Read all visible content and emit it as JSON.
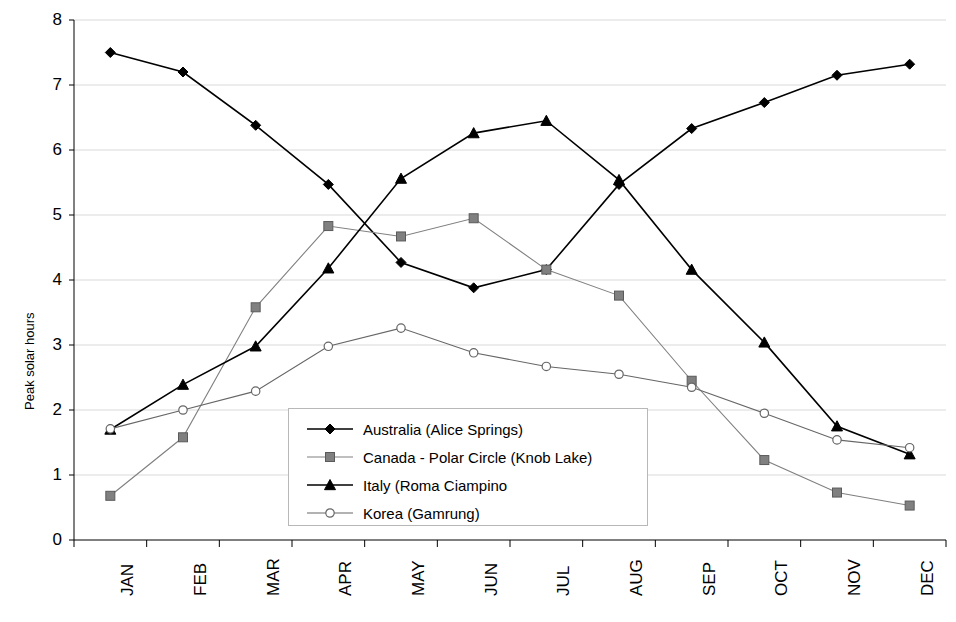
{
  "chart_data": {
    "type": "line",
    "title": "",
    "xlabel": "",
    "ylabel": "Peak solar hours",
    "categories": [
      "JAN",
      "FEB",
      "MAR",
      "APR",
      "MAY",
      "JUN",
      "JUL",
      "AUG",
      "SEP",
      "OCT",
      "NOV",
      "DEC"
    ],
    "ylim": [
      0,
      8
    ],
    "yticks": [
      0,
      1,
      2,
      3,
      4,
      5,
      6,
      7,
      8
    ],
    "grid": true,
    "legend_position": "inside-bottom-center",
    "series": [
      {
        "name": "Australia (Alice Springs)",
        "marker": "diamond-filled",
        "color": "#000000",
        "values": [
          7.5,
          7.2,
          6.38,
          5.47,
          4.27,
          3.88,
          4.16,
          5.47,
          6.33,
          6.73,
          7.15,
          7.32
        ]
      },
      {
        "name": "Canada - Polar Circle (Knob Lake)",
        "marker": "square-filled",
        "color": "#808080",
        "values": [
          0.68,
          1.58,
          3.58,
          4.83,
          4.67,
          4.95,
          4.16,
          3.76,
          2.45,
          1.23,
          0.73,
          0.53
        ]
      },
      {
        "name": "Italy (Roma Ciampino",
        "marker": "triangle-filled",
        "color": "#000000",
        "values": [
          1.7,
          2.39,
          2.98,
          4.18,
          5.56,
          6.26,
          6.45,
          5.54,
          4.16,
          3.04,
          1.75,
          1.32
        ]
      },
      {
        "name": "Korea (Gamrung)",
        "marker": "circle-open",
        "color": "#666666",
        "values": [
          1.71,
          2.0,
          2.29,
          2.98,
          3.26,
          2.88,
          2.67,
          2.55,
          2.35,
          1.95,
          1.54,
          1.42
        ]
      }
    ]
  },
  "legend": {
    "entries": [
      "Australia (Alice Springs)",
      "Canada - Polar Circle (Knob Lake)",
      "Italy (Roma Ciampino",
      "Korea (Gamrung)"
    ]
  },
  "axes": {
    "y_title": "Peak solar hours",
    "y_tick_labels": [
      "8",
      "7",
      "6",
      "5",
      "4",
      "3",
      "2",
      "1",
      "0"
    ],
    "x_tick_labels": [
      "JAN",
      "FEB",
      "MAR",
      "APR",
      "MAY",
      "JUN",
      "JUL",
      "AUG",
      "SEP",
      "OCT",
      "NOV",
      "DEC"
    ]
  },
  "colors": {
    "axis": "#000000",
    "grid": "#d9d9d9",
    "plot_background": "#ffffff",
    "series_black": "#000000",
    "series_gray": "#808080"
  }
}
